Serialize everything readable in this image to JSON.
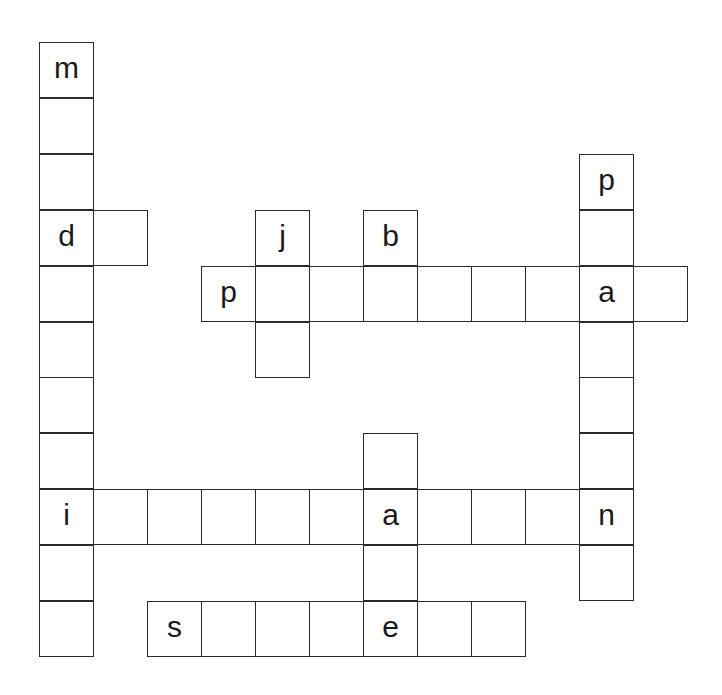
{
  "puzzle": {
    "type": "crossword-grid",
    "grid_origin": {
      "x": 39,
      "y": 42
    },
    "cell_width": 54,
    "cell_height": 55.9,
    "cells": [
      {
        "row": 0,
        "col": 0,
        "letter": "m"
      },
      {
        "row": 1,
        "col": 0,
        "letter": ""
      },
      {
        "row": 2,
        "col": 0,
        "letter": ""
      },
      {
        "row": 3,
        "col": 0,
        "letter": "d"
      },
      {
        "row": 4,
        "col": 0,
        "letter": ""
      },
      {
        "row": 5,
        "col": 0,
        "letter": ""
      },
      {
        "row": 6,
        "col": 0,
        "letter": ""
      },
      {
        "row": 7,
        "col": 0,
        "letter": ""
      },
      {
        "row": 8,
        "col": 0,
        "letter": "i"
      },
      {
        "row": 9,
        "col": 0,
        "letter": ""
      },
      {
        "row": 10,
        "col": 0,
        "letter": ""
      },
      {
        "row": 3,
        "col": 1,
        "letter": ""
      },
      {
        "row": 3,
        "col": 4,
        "letter": "j"
      },
      {
        "row": 5,
        "col": 4,
        "letter": ""
      },
      {
        "row": 3,
        "col": 6,
        "letter": "b"
      },
      {
        "row": 4,
        "col": 3,
        "letter": "p"
      },
      {
        "row": 4,
        "col": 4,
        "letter": ""
      },
      {
        "row": 4,
        "col": 5,
        "letter": ""
      },
      {
        "row": 4,
        "col": 6,
        "letter": ""
      },
      {
        "row": 4,
        "col": 7,
        "letter": ""
      },
      {
        "row": 4,
        "col": 8,
        "letter": ""
      },
      {
        "row": 4,
        "col": 9,
        "letter": ""
      },
      {
        "row": 4,
        "col": 10,
        "letter": "a"
      },
      {
        "row": 4,
        "col": 11,
        "letter": ""
      },
      {
        "row": 2,
        "col": 10,
        "letter": "p"
      },
      {
        "row": 3,
        "col": 10,
        "letter": ""
      },
      {
        "row": 5,
        "col": 10,
        "letter": ""
      },
      {
        "row": 6,
        "col": 10,
        "letter": ""
      },
      {
        "row": 7,
        "col": 10,
        "letter": ""
      },
      {
        "row": 8,
        "col": 10,
        "letter": "n"
      },
      {
        "row": 9,
        "col": 10,
        "letter": ""
      },
      {
        "row": 8,
        "col": 1,
        "letter": ""
      },
      {
        "row": 8,
        "col": 2,
        "letter": ""
      },
      {
        "row": 8,
        "col": 3,
        "letter": ""
      },
      {
        "row": 8,
        "col": 4,
        "letter": ""
      },
      {
        "row": 8,
        "col": 5,
        "letter": ""
      },
      {
        "row": 8,
        "col": 6,
        "letter": "a"
      },
      {
        "row": 8,
        "col": 7,
        "letter": ""
      },
      {
        "row": 8,
        "col": 8,
        "letter": ""
      },
      {
        "row": 8,
        "col": 9,
        "letter": ""
      },
      {
        "row": 7,
        "col": 6,
        "letter": ""
      },
      {
        "row": 9,
        "col": 6,
        "letter": ""
      },
      {
        "row": 10,
        "col": 2,
        "letter": "s"
      },
      {
        "row": 10,
        "col": 3,
        "letter": ""
      },
      {
        "row": 10,
        "col": 4,
        "letter": ""
      },
      {
        "row": 10,
        "col": 5,
        "letter": ""
      },
      {
        "row": 10,
        "col": 6,
        "letter": "e"
      },
      {
        "row": 10,
        "col": 7,
        "letter": ""
      },
      {
        "row": 10,
        "col": 8,
        "letter": ""
      }
    ]
  }
}
